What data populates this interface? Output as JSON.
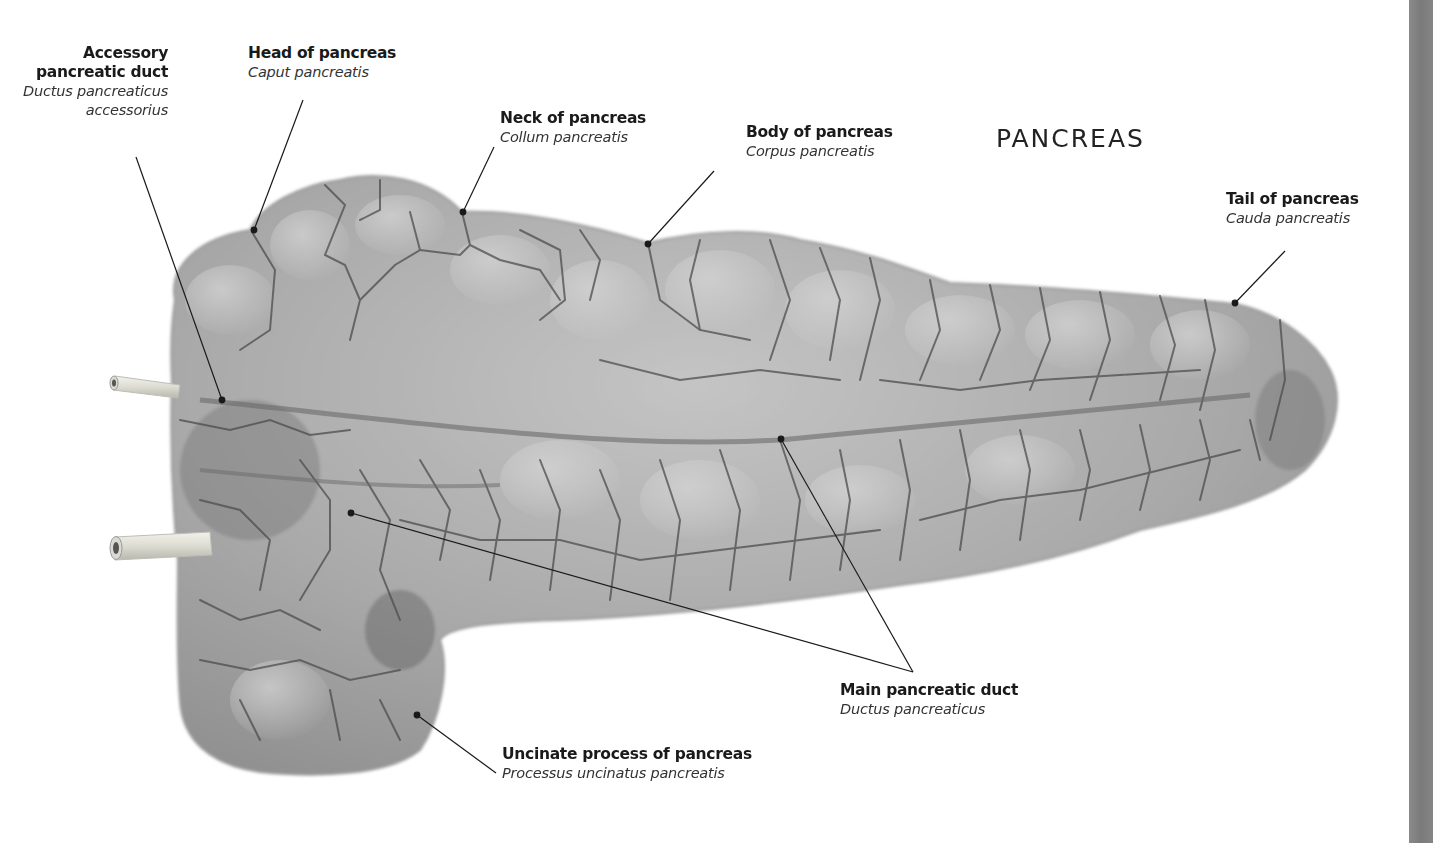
{
  "title": "PANCREAS",
  "labels": {
    "accessory_duct": {
      "en_line1": "Accessory",
      "en_line2": "pancreatic duct",
      "la_line1": "Ductus pancreaticus",
      "la_line2": "accessorius"
    },
    "head": {
      "en": "Head of pancreas",
      "la": "Caput pancreatis"
    },
    "neck": {
      "en": "Neck of pancreas",
      "la": "Collum pancreatis"
    },
    "body": {
      "en": "Body of pancreas",
      "la": "Corpus pancreatis"
    },
    "tail": {
      "en": "Tail of pancreas",
      "la": "Cauda pancreatis"
    },
    "main_duct": {
      "en": "Main pancreatic duct",
      "la": "Ductus pancreaticus"
    },
    "uncinate": {
      "en": "Uncinate process of pancreas",
      "la": "Processus uncinatus pancreatis"
    }
  },
  "colors": {
    "organ_fill": "#a8a8a8",
    "organ_light": "#c9c9c9",
    "organ_shadow": "#6f6f6f",
    "lobule_lines": "#4a4a4a",
    "leader_lines": "#1a1a1a",
    "edge_bar": "#808080"
  }
}
